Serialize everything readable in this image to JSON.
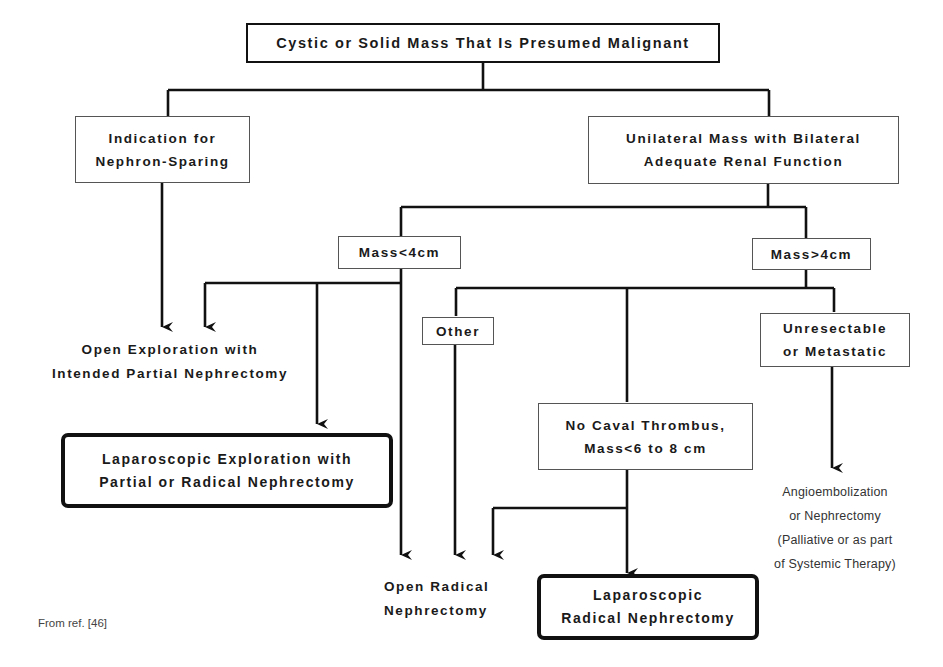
{
  "root": {
    "label": "Cystic or Solid Mass That Is Presumed Malignant"
  },
  "nephron_sparing": {
    "lines": [
      "Indication for",
      "Nephron-Sparing"
    ]
  },
  "unilateral": {
    "lines": [
      "Unilateral Mass with Bilateral",
      "Adequate Renal Function"
    ]
  },
  "mass_small": {
    "label": "Mass<4cm"
  },
  "mass_large": {
    "label": "Mass>4cm"
  },
  "other": {
    "label": "Other"
  },
  "unresectable": {
    "lines": [
      "Unresectable",
      "or Metastatic"
    ]
  },
  "no_caval": {
    "lines": [
      "No Caval Thrombus,",
      "Mass<6 to 8 cm"
    ]
  },
  "open_exploration": {
    "lines": [
      "Open Exploration with",
      "Intended Partial Nephrectomy"
    ]
  },
  "lap_exploration": {
    "lines": [
      "Laparoscopic Exploration with",
      "Partial or Radical Nephrectomy"
    ]
  },
  "open_radical": {
    "lines": [
      "Open Radical",
      "Nephrectomy"
    ]
  },
  "lap_radical": {
    "lines": [
      "Laparoscopic",
      "Radical Nephrectomy"
    ]
  },
  "angio": {
    "lines": [
      "Angioembolization",
      "or Nephrectomy",
      "(Palliative or as part",
      "of Systemic Therapy)"
    ]
  },
  "caption": {
    "text": "From ref. [46]"
  },
  "colors": {
    "line": "#111111",
    "thin_border": "#555555",
    "background": "#ffffff"
  }
}
